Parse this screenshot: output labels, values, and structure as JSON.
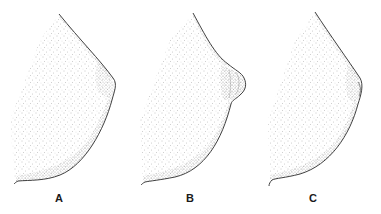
{
  "figure": {
    "background": "#ffffff",
    "ink_color": "#2a2a2a",
    "panels": [
      {
        "id": "A",
        "label": "A",
        "label_x": 59,
        "label_y": 192
      },
      {
        "id": "B",
        "label": "B",
        "label_x": 190,
        "label_y": 192
      },
      {
        "id": "C",
        "label": "C",
        "label_x": 313,
        "label_y": 192
      }
    ]
  }
}
